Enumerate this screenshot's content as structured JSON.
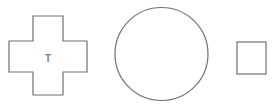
{
  "canvas": {
    "width": 275,
    "height": 108,
    "background": "#ffffff"
  },
  "shapes": [
    {
      "type": "cross",
      "label": "T",
      "stroke": "#707070"
    },
    {
      "type": "circle",
      "label": "",
      "stroke": "#707070"
    },
    {
      "type": "square",
      "label": "",
      "stroke": "#707070"
    }
  ]
}
